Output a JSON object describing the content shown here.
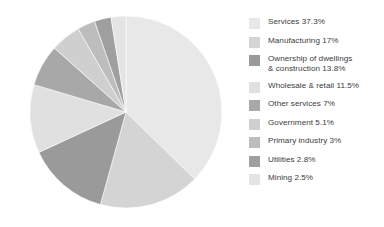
{
  "chart_data": {
    "type": "pie",
    "title": "",
    "subtitle": "",
    "xlabel": "",
    "ylabel": "",
    "legend_position": "right",
    "grid": false,
    "start_angle_deg": 0,
    "direction": "clockwise",
    "categories": [
      "Services",
      "Manufacturing",
      "Ownership of dwellings & construction",
      "Wholesale & retail",
      "Other services",
      "Government",
      "Primary industry",
      "Utilities",
      "Mining"
    ],
    "values": [
      37.3,
      17,
      13.8,
      11.5,
      7,
      5.1,
      3,
      2.8,
      2.5
    ],
    "value_unit": "%",
    "total": 100.0,
    "colors": [
      "#e8e8e8",
      "#d4d4d4",
      "#9a9a9a",
      "#e0e0e0",
      "#a8a8a8",
      "#cfcfcf",
      "#bdbdbd",
      "#9f9f9f",
      "#e4e4e4"
    ],
    "slices": [
      {
        "label": "Services",
        "value": 37.3,
        "display": "Services 37.3%",
        "color": "#e8e8e8"
      },
      {
        "label": "Manufacturing",
        "value": 17,
        "display": "Manufacturing 17%",
        "color": "#d4d4d4"
      },
      {
        "label": "Ownership of dwellings & construction",
        "value": 13.8,
        "display": "Ownership of dwellings\n& construction 13.8%",
        "color": "#9a9a9a"
      },
      {
        "label": "Wholesale & retail",
        "value": 11.5,
        "display": "Wholesale & retail 11.5%",
        "color": "#e0e0e0"
      },
      {
        "label": "Other services",
        "value": 7,
        "display": "Other services 7%",
        "color": "#a8a8a8"
      },
      {
        "label": "Government",
        "value": 5.1,
        "display": "Government 5.1%",
        "color": "#cfcfcf"
      },
      {
        "label": "Primary industry",
        "value": 3,
        "display": "Primary industry 3%",
        "color": "#bdbdbd"
      },
      {
        "label": "Utilities",
        "value": 2.8,
        "display": "Utilities 2.8%",
        "color": "#9f9f9f"
      },
      {
        "label": "Mining",
        "value": 2.5,
        "display": "Mining 2.5%",
        "color": "#e4e4e4"
      }
    ]
  },
  "figure": {
    "background_color": "#ffffff",
    "text_color": "#3b3b3b"
  },
  "legend": {
    "entries": [
      {
        "label": "Services 37.3%",
        "color": "#e8e8e8"
      },
      {
        "label": "Manufacturing 17%",
        "color": "#d4d4d4"
      },
      {
        "label": "Ownership of dwellings\n& construction 13.8%",
        "color": "#9a9a9a"
      },
      {
        "label": "Wholesale & retail 11.5%",
        "color": "#e0e0e0"
      },
      {
        "label": "Other services 7%",
        "color": "#a8a8a8"
      },
      {
        "label": "Government 5.1%",
        "color": "#cfcfcf"
      },
      {
        "label": "Primary industry 3%",
        "color": "#bdbdbd"
      },
      {
        "label": "Utilities 2.8%",
        "color": "#9f9f9f"
      },
      {
        "label": "Mining 2.5%",
        "color": "#e4e4e4"
      }
    ]
  }
}
